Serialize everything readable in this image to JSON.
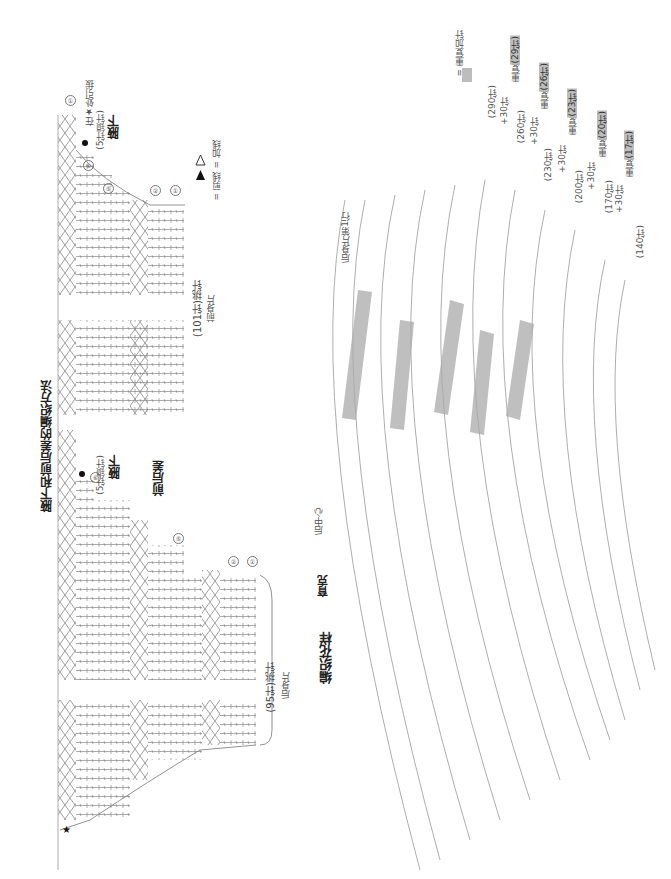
{
  "section1": {
    "title": "腋下和前后差的编织方法",
    "front_underarm": {
      "label": "腋下",
      "note": "(5针锁针)",
      "star_note": "在★处引拔",
      "row_markers": [
        "①",
        "⑥",
        "⑤",
        "②",
        "①"
      ]
    },
    "back_underarm": {
      "label": "腋下",
      "note": "(5针锁针)",
      "row_marker": "⑥"
    },
    "front_back_diff": "前后差",
    "front_piece": {
      "count": "(101针)挑针",
      "name": "前身片"
    },
    "back_piece": {
      "count": "(95针)挑针",
      "name": "后身片",
      "row_markers": [
        "⑤",
        "②",
        "①"
      ]
    },
    "legend": [
      {
        "symbol": "open-triangle",
        "text": "= 加线"
      },
      {
        "symbol": "filled-triangle",
        "text": "= 剪线"
      }
    ]
  },
  "section2": {
    "title": "编织花样",
    "subtitle": "育克",
    "back_center": "后中心",
    "back_row1": "后身片第1行",
    "legend": {
      "text": "= 重复加针",
      "swatch_color": "#bdbdbd"
    },
    "rows": [
      {
        "marker": "①",
        "count": "(140针)"
      },
      {
        "marker": "②",
        "count": ""
      },
      {
        "marker": "③",
        "count": "(170针)",
        "plus": "+30针"
      },
      {
        "marker": "⑤",
        "count": "(200针)",
        "plus": "+30针"
      },
      {
        "marker": "⑦",
        "count": "(230针)",
        "plus": "+30针"
      },
      {
        "marker": "⑨",
        "count": "(260针)",
        "plus": "+30针"
      },
      {
        "marker": "⑩",
        "count": ""
      },
      {
        "marker": "⑪",
        "count": "(290针)",
        "plus": "+30针"
      },
      {
        "marker": "⑫",
        "count": ""
      }
    ],
    "repeats": [
      {
        "label": "重复",
        "value": "(17针)"
      },
      {
        "label": "重复",
        "value": "(20针)"
      },
      {
        "label": "重复",
        "value": "(23针)"
      },
      {
        "label": "重复",
        "value": "(26针)"
      },
      {
        "label": "重复",
        "value": "(29针)"
      }
    ]
  }
}
